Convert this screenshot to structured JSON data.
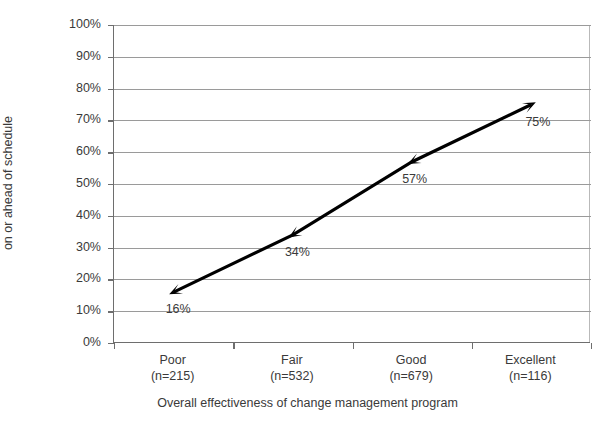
{
  "chart_data": {
    "type": "line",
    "title": "",
    "xlabel": "Overall effectiveness of change management program",
    "ylabel": "Percent of respondents that were on or ahead of schedule",
    "ylabel_lines": [
      "Percent of respondents that were",
      "on or ahead of schedule"
    ],
    "categories": [
      "Poor",
      "Fair",
      "Good",
      "Excellent"
    ],
    "category_counts": [
      "(n=215)",
      "(n=532)",
      "(n=679)",
      "(n=116)"
    ],
    "values": [
      16,
      34,
      57,
      75
    ],
    "point_labels": [
      "16%",
      "34%",
      "57%",
      "75%"
    ],
    "ylim": [
      0,
      100
    ],
    "ytick_labels": [
      "0%",
      "10%",
      "20%",
      "30%",
      "40%",
      "50%",
      "60%",
      "70%",
      "80%",
      "90%",
      "100%"
    ],
    "ytick_values": [
      0,
      10,
      20,
      30,
      40,
      50,
      60,
      70,
      80,
      90,
      100
    ],
    "grid": true,
    "legend": false,
    "series_color": "#000000",
    "grid_color": "#9a9a9a",
    "axis_color": "#6e6e6e",
    "text_color": "#3a3a3a",
    "marker": "triangle-arrowhead"
  }
}
